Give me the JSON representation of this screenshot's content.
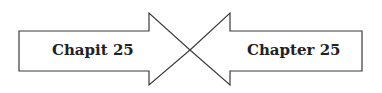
{
  "diagram": {
    "left_arrow": {
      "label": "Chapit 25",
      "direction": "right"
    },
    "right_arrow": {
      "label": "Chapter 25",
      "direction": "left"
    },
    "colors": {
      "stroke": "#3a3a3a",
      "fill": "#ffffff",
      "text": "#222222"
    }
  }
}
